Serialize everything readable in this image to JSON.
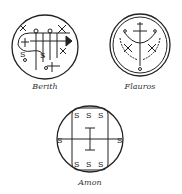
{
  "seals": [
    {
      "name": "Berith",
      "label": "Berith"
    },
    {
      "name": "Flauros",
      "label": "Flauros"
    },
    {
      "name": "Amon",
      "label": "Amon"
    }
  ],
  "colors": {
    "ink": "#222222",
    "background": "#ffffff"
  }
}
